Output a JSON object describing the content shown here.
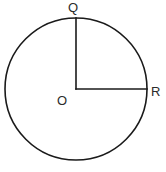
{
  "figure": {
    "name": "circle-with-two-radii",
    "background_color": "#ffffff",
    "stroke_color": "#1a1a1a",
    "text_color": "#2b2b2b",
    "width": 166,
    "height": 172
  },
  "circle": {
    "center_x": 76,
    "center_y": 89,
    "radius": 71,
    "stroke_width": 1.6
  },
  "radii": [
    {
      "name": "radius-OQ",
      "from_point": "O",
      "to_point": "Q",
      "x1": 76,
      "y1": 89,
      "x2": 76,
      "y2": 18,
      "orientation": "vertical"
    },
    {
      "name": "radius-OR",
      "from_point": "O",
      "to_point": "R",
      "x1": 76,
      "y1": 89,
      "x2": 147,
      "y2": 89,
      "orientation": "horizontal"
    }
  ],
  "labels": {
    "top_point": "Q",
    "center_point": "O",
    "right_point": "R"
  },
  "angle": {
    "vertex": "O",
    "between": "QOR",
    "degrees": 90
  }
}
